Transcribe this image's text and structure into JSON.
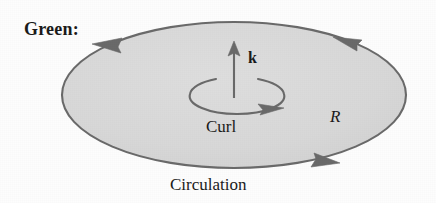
{
  "figure": {
    "kind": "greens-theorem-diagram",
    "caption_label": "Green:",
    "labels": {
      "theorem_name": "Green:",
      "normal_vector": "k",
      "curl": "Curl",
      "region": "R",
      "circulation": "Circulation"
    },
    "colors": {
      "background": "#fdfdfd",
      "region_fill": "#d8d8d8",
      "stroke": "#6a6a6a",
      "text": "#1a1a1a"
    },
    "geometry": {
      "region_ellipse": {
        "cx": 234,
        "cy": 95,
        "rx": 172,
        "ry": 73
      },
      "curl_ellipse": {
        "cx": 237,
        "cy": 96,
        "rx": 47,
        "ry": 18
      },
      "normal_arrow": {
        "x": 234,
        "y_tail": 96,
        "y_tip": 44
      }
    },
    "boundary_orientation": "counterclockwise",
    "boundary_arrow_count": 3,
    "curl_arrow_count": 1
  }
}
